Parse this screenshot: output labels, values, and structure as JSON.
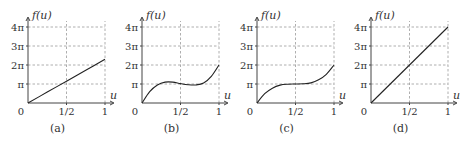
{
  "chart_data": [
    {
      "type": "line",
      "caption": "(a)",
      "xlabel": "u",
      "ylabel": "f(u)",
      "x_ticks": [
        "0",
        "1/2",
        "1"
      ],
      "y_ticks": [
        "π",
        "2π",
        "3π",
        "4π"
      ],
      "xlim": [
        0,
        1
      ],
      "ylim_pi": [
        0,
        4
      ],
      "grid": true,
      "x": [
        0,
        0.25,
        0.5,
        0.75,
        1
      ],
      "y_pi": [
        0,
        0.575,
        1.15,
        1.725,
        2.3
      ]
    },
    {
      "type": "line",
      "caption": "(b)",
      "xlabel": "u",
      "ylabel": "f(u)",
      "x_ticks": [
        "0",
        "1/2",
        "1"
      ],
      "y_ticks": [
        "π",
        "2π",
        "3π",
        "4π"
      ],
      "xlim": [
        0,
        1
      ],
      "ylim_pi": [
        0,
        4
      ],
      "grid": true,
      "x": [
        0,
        0.1,
        0.2,
        0.3,
        0.4,
        0.5,
        0.6,
        0.7,
        0.8,
        0.9,
        1
      ],
      "y_pi": [
        0,
        0.6,
        0.95,
        1.1,
        1.1,
        1.02,
        0.96,
        0.95,
        1.05,
        1.4,
        2.0
      ]
    },
    {
      "type": "line",
      "caption": "(c)",
      "xlabel": "u",
      "ylabel": "f(u)",
      "x_ticks": [
        "0",
        "1/2",
        "1"
      ],
      "y_ticks": [
        "π",
        "2π",
        "3π",
        "4π"
      ],
      "xlim": [
        0,
        1
      ],
      "ylim_pi": [
        0,
        4
      ],
      "grid": true,
      "x": [
        0,
        0.1,
        0.2,
        0.3,
        0.4,
        0.5,
        0.6,
        0.7,
        0.8,
        0.9,
        1
      ],
      "y_pi": [
        0,
        0.49,
        0.78,
        0.94,
        0.99,
        1.0,
        1.01,
        1.06,
        1.22,
        1.51,
        2.0
      ]
    },
    {
      "type": "line",
      "caption": "(d)",
      "xlabel": "u",
      "ylabel": "f(u)",
      "x_ticks": [
        "0",
        "1/2",
        "1"
      ],
      "y_ticks": [
        "π",
        "2π",
        "3π",
        "4π"
      ],
      "xlim": [
        0,
        1
      ],
      "ylim_pi": [
        0,
        4
      ],
      "grid": true,
      "x": [
        0,
        0.5,
        1
      ],
      "y_pi": [
        0,
        2,
        4
      ]
    }
  ]
}
